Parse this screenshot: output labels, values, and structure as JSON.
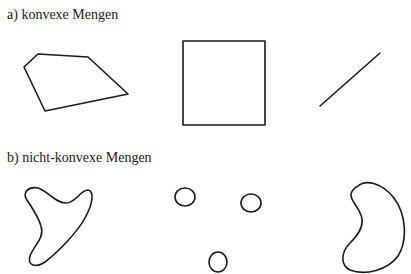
{
  "sections": [
    {
      "label": "a) konvexe Mengen",
      "shapes": [
        "convex-pentagon",
        "square",
        "line-segment"
      ]
    },
    {
      "label": "b) nicht-konvexe Mengen",
      "shapes": [
        "boomerang-blob",
        "three-disjoint-circles",
        "kidney-shape"
      ]
    }
  ],
  "colors": {
    "stroke": "#1a1a1a",
    "background": "#ffffff"
  }
}
